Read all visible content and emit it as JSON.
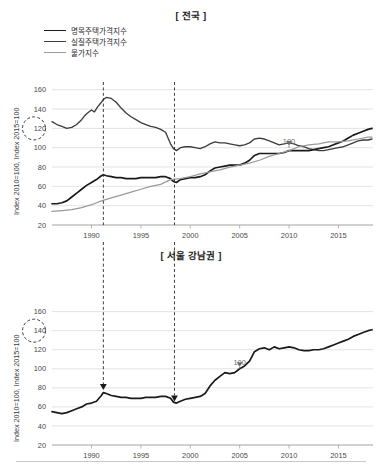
{
  "figure": {
    "panels": [
      "national",
      "gangnam"
    ],
    "footer_rule": true
  },
  "top": {
    "title": "[ 전국 ]",
    "y_axis_label": "Index 2010=100, Index 2015=100",
    "legend": [
      {
        "label": "명목주택가격지수",
        "color": "#1a1a1a"
      },
      {
        "label": "실질주택가격지수",
        "color": "#3d3d3d"
      },
      {
        "label": "물가지수",
        "color": "#9a9a9a"
      }
    ],
    "annotation_100": "100",
    "circle_value": "120"
  },
  "bottom": {
    "title": "[ 서울 강남권 ]",
    "y_axis_label": "Index 2010=100, Index 2015=100",
    "annotation_100": "100",
    "circle_value": "140"
  },
  "chart_data": [
    {
      "id": "national",
      "type": "line",
      "title": "[ 전국 ]",
      "xlabel": "",
      "ylabel": "Index 2010=100, Index 2015=100",
      "xlim": [
        1986,
        2018.5
      ],
      "ylim": [
        20,
        168
      ],
      "yticks": [
        20,
        40,
        60,
        80,
        100,
        120,
        140,
        160
      ],
      "xticks": [
        1990,
        1995,
        2000,
        2005,
        2010,
        2015
      ],
      "grid": true,
      "legend_position": "top-left",
      "annotations": [
        {
          "text": "100",
          "x": 2010,
          "y": 100,
          "type": "arrow-down"
        },
        {
          "text": "120",
          "x": 1986,
          "y": 120,
          "type": "dashed-circle-on-axis"
        },
        {
          "text": "",
          "x": 1991.2,
          "type": "dashed-vertical"
        },
        {
          "text": "",
          "x": 1998.4,
          "type": "dashed-vertical"
        }
      ],
      "series": [
        {
          "name": "실질주택가격지수",
          "color": "#3d3d3d",
          "x": [
            1986.0,
            1986.5,
            1987.0,
            1987.5,
            1988.0,
            1988.5,
            1989.0,
            1989.3,
            1989.6,
            1990.0,
            1990.3,
            1990.6,
            1991.0,
            1991.2,
            1991.5,
            1992.0,
            1992.5,
            1993.0,
            1993.5,
            1994.0,
            1994.5,
            1995.0,
            1995.5,
            1996.0,
            1996.5,
            1997.0,
            1997.5,
            1998.0,
            1998.3,
            1998.6,
            1999.0,
            1999.5,
            2000.0,
            2000.5,
            2001.0,
            2001.5,
            2002.0,
            2002.5,
            2003.0,
            2003.5,
            2004.0,
            2004.5,
            2005.0,
            2005.5,
            2006.0,
            2006.5,
            2007.0,
            2007.5,
            2008.0,
            2008.5,
            2009.0,
            2009.5,
            2010.0,
            2010.5,
            2011.0,
            2011.5,
            2012.0,
            2012.5,
            2013.0,
            2013.5,
            2014.0,
            2014.5,
            2015.0,
            2015.5,
            2016.0,
            2016.5,
            2017.0,
            2017.5,
            2018.0,
            2018.4
          ],
          "y": [
            127,
            124,
            122,
            120,
            121,
            124,
            129,
            133,
            136,
            139,
            137,
            142,
            147,
            150,
            152,
            151,
            147,
            141,
            136,
            132,
            129,
            126,
            124,
            122,
            121,
            119,
            116,
            104,
            99,
            97,
            100,
            101,
            101,
            100,
            99,
            101,
            104,
            106,
            105,
            105,
            104,
            103,
            102,
            103,
            105,
            109,
            110,
            109,
            107,
            105,
            103,
            104,
            105,
            104,
            102,
            101,
            99,
            98,
            97,
            97,
            98,
            99,
            100,
            101,
            103,
            105,
            107,
            108,
            108,
            109
          ]
        },
        {
          "name": "명목주택가격지수",
          "color": "#1a1a1a",
          "x": [
            1986.0,
            1986.5,
            1987.0,
            1987.5,
            1988.0,
            1988.5,
            1989.0,
            1989.5,
            1990.0,
            1990.5,
            1991.0,
            1991.2,
            1991.5,
            1992.0,
            1992.5,
            1993.0,
            1993.5,
            1994.0,
            1994.5,
            1995.0,
            1995.5,
            1996.0,
            1996.5,
            1997.0,
            1997.5,
            1998.0,
            1998.3,
            1998.6,
            1999.0,
            1999.5,
            2000.0,
            2000.5,
            2001.0,
            2001.5,
            2002.0,
            2002.5,
            2003.0,
            2003.5,
            2004.0,
            2004.5,
            2005.0,
            2005.5,
            2006.0,
            2006.5,
            2007.0,
            2007.5,
            2008.0,
            2008.5,
            2009.0,
            2009.5,
            2010.0,
            2010.5,
            2011.0,
            2011.5,
            2012.0,
            2012.5,
            2013.0,
            2013.5,
            2014.0,
            2014.5,
            2015.0,
            2015.5,
            2016.0,
            2016.5,
            2017.0,
            2017.5,
            2018.0,
            2018.4
          ],
          "y": [
            42,
            42,
            43,
            45,
            49,
            53,
            57,
            61,
            64,
            67,
            71,
            72,
            71,
            70,
            69,
            69,
            68,
            68,
            68,
            69,
            69,
            69,
            69,
            70,
            70,
            68,
            65,
            64,
            67,
            68,
            69,
            69,
            70,
            72,
            76,
            79,
            80,
            81,
            82,
            82,
            82,
            84,
            87,
            92,
            94,
            94,
            94,
            94,
            94,
            95,
            97,
            97,
            97,
            97,
            97,
            98,
            99,
            100,
            101,
            103,
            105,
            107,
            110,
            113,
            115,
            117,
            119,
            120,
            120,
            121
          ]
        },
        {
          "name": "물가지수",
          "color": "#9a9a9a",
          "x": [
            1986.0,
            1987.0,
            1988.0,
            1989.0,
            1990.0,
            1991.0,
            1992.0,
            1993.0,
            1994.0,
            1995.0,
            1996.0,
            1997.0,
            1998.0,
            1999.0,
            2000.0,
            2001.0,
            2002.0,
            2003.0,
            2004.0,
            2005.0,
            2006.0,
            2007.0,
            2008.0,
            2009.0,
            2010.0,
            2011.0,
            2012.0,
            2013.0,
            2014.0,
            2015.0,
            2016.0,
            2017.0,
            2018.0,
            2018.4
          ],
          "y": [
            34,
            35,
            36,
            38,
            41,
            45,
            48,
            51,
            54,
            57,
            60,
            62,
            67,
            68,
            70,
            73,
            75,
            77,
            80,
            82,
            84,
            87,
            91,
            94,
            97,
            101,
            103,
            104,
            106,
            106,
            107,
            109,
            111,
            111
          ]
        }
      ]
    },
    {
      "id": "gangnam",
      "type": "line",
      "title": "[ 서울 강남권 ]",
      "xlabel": "",
      "ylabel": "Index 2010=100, Index 2015=100",
      "xlim": [
        1986,
        2018.5
      ],
      "ylim": [
        20,
        168
      ],
      "yticks": [
        20,
        40,
        60,
        80,
        100,
        120,
        140,
        160
      ],
      "xticks": [
        1990,
        1995,
        2000,
        2005,
        2010,
        2015
      ],
      "grid": true,
      "legend_position": "none",
      "annotations": [
        {
          "text": "100",
          "x": 2005,
          "y": 100,
          "type": "arrow-down"
        },
        {
          "text": "140",
          "x": 1986,
          "y": 140,
          "type": "dashed-circle-on-axis"
        },
        {
          "text": "",
          "x": 1991.2,
          "type": "dashed-vertical-arrow"
        },
        {
          "text": "",
          "x": 1998.4,
          "type": "dashed-vertical-arrow"
        }
      ],
      "series": [
        {
          "name": "서울 강남권 주택가격지수",
          "color": "#1a1a1a",
          "x": [
            1986.0,
            1986.5,
            1987.0,
            1987.5,
            1988.0,
            1988.5,
            1989.0,
            1989.5,
            1990.0,
            1990.5,
            1991.0,
            1991.2,
            1991.5,
            1992.0,
            1992.5,
            1993.0,
            1993.5,
            1994.0,
            1994.5,
            1995.0,
            1995.5,
            1996.0,
            1996.5,
            1997.0,
            1997.5,
            1998.0,
            1998.3,
            1998.6,
            1999.0,
            1999.5,
            2000.0,
            2000.5,
            2001.0,
            2001.5,
            2002.0,
            2002.5,
            2003.0,
            2003.5,
            2004.0,
            2004.5,
            2005.0,
            2005.5,
            2006.0,
            2006.5,
            2007.0,
            2007.5,
            2008.0,
            2008.5,
            2009.0,
            2009.5,
            2010.0,
            2010.5,
            2011.0,
            2011.5,
            2012.0,
            2012.5,
            2013.0,
            2013.5,
            2014.0,
            2014.5,
            2015.0,
            2015.5,
            2016.0,
            2016.5,
            2017.0,
            2017.5,
            2018.0,
            2018.4
          ],
          "y": [
            55,
            54,
            53,
            54,
            56,
            58,
            60,
            63,
            64,
            66,
            72,
            75,
            74,
            72,
            71,
            70,
            70,
            69,
            69,
            69,
            70,
            70,
            70,
            71,
            71,
            69,
            65,
            64,
            66,
            68,
            69,
            70,
            71,
            74,
            82,
            88,
            92,
            96,
            95,
            96,
            100,
            103,
            108,
            118,
            121,
            122,
            120,
            123,
            121,
            122,
            123,
            122,
            120,
            119,
            119,
            120,
            120,
            121,
            123,
            125,
            127,
            129,
            131,
            134,
            136,
            138,
            140,
            141
          ]
        }
      ]
    }
  ]
}
